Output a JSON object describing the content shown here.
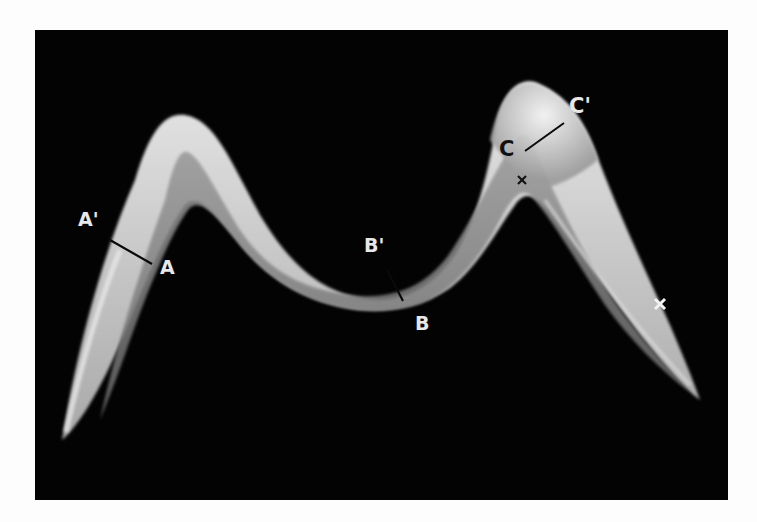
{
  "figure": {
    "background_color": "#030303",
    "page_color": "#fdfdfd",
    "band_light_color": "#d9d9d9",
    "band_dark_color": "#7a7a7a",
    "section_lines": [
      {
        "id": "A",
        "label_inner": "A",
        "label_outer": "A'"
      },
      {
        "id": "B",
        "label_inner": "B",
        "label_outer": "B'"
      },
      {
        "id": "C",
        "label_inner": "C",
        "label_outer": "C'"
      }
    ],
    "markers": [
      {
        "name": "cross-marker-dark",
        "glyph": "×"
      },
      {
        "name": "cross-marker-light",
        "glyph": "✕"
      }
    ]
  }
}
